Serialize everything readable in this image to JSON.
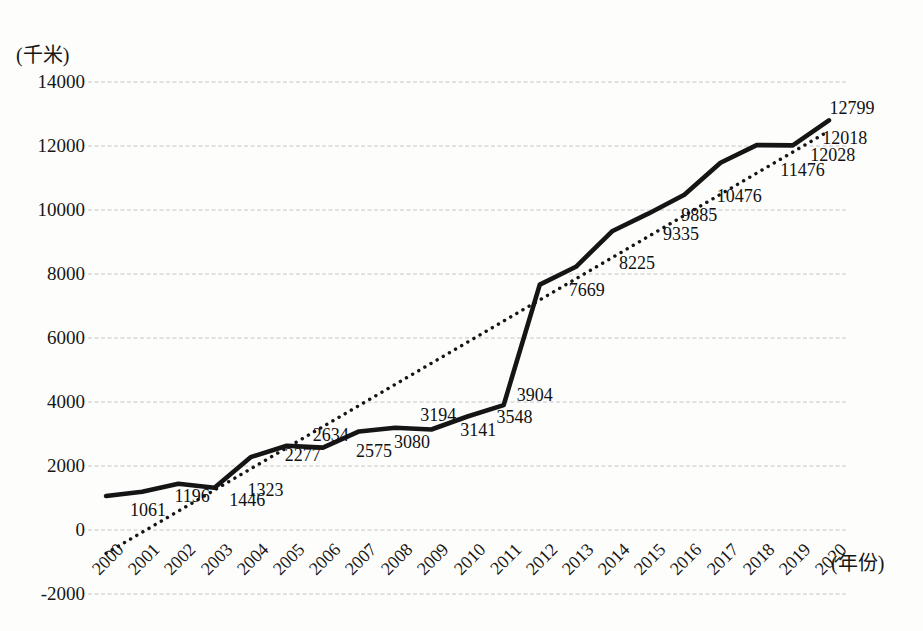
{
  "chart_data": {
    "type": "line",
    "title": "",
    "y_unit_label": "(千米)",
    "x_unit_label": "(年份)",
    "categories": [
      "2000",
      "2001",
      "2002",
      "2003",
      "2004",
      "2005",
      "2006",
      "2007",
      "2008",
      "2009",
      "2010",
      "2011",
      "2012",
      "2013",
      "2014",
      "2015",
      "2016",
      "2017",
      "2018",
      "2019",
      "2020"
    ],
    "series": [
      {
        "name": "mileage-solid-line",
        "style": "solid",
        "color": "#151515",
        "values": [
          1061,
          1196,
          1446,
          1323,
          2277,
          2634,
          2575,
          3080,
          3194,
          3141,
          3548,
          3904,
          7669,
          8225,
          9335,
          9885,
          10476,
          11476,
          12028,
          12018,
          12799
        ],
        "data_labels_visible": true
      }
    ],
    "trendline": {
      "name": "linear-trendline",
      "style": "dotted",
      "color": "#151515",
      "start_value": -730,
      "end_value": 12470
    },
    "y_ticks": [
      14000,
      12000,
      10000,
      8000,
      6000,
      4000,
      2000,
      0,
      -2000
    ],
    "ylim": [
      -2000,
      14000
    ],
    "ytick_step": 2000,
    "grid": true,
    "grid_style": "dashed",
    "legend": "none",
    "colors": {
      "line": "#151515",
      "trend": "#151515",
      "grid": "#c6c6c6",
      "text": "#161616",
      "background": "#fdfdfc"
    }
  }
}
